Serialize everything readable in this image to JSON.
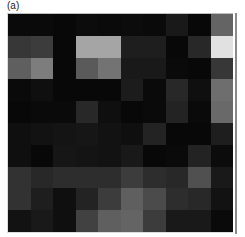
{
  "panel_label": "(a)",
  "chart_data": {
    "type": "heatmap",
    "title": "(a)",
    "colormap": "grayscale",
    "rows": 10,
    "cols": 10,
    "xlabel": "",
    "ylabel": "",
    "value_range": [
      0,
      255
    ],
    "values": [
      [
        10,
        10,
        8,
        12,
        10,
        12,
        10,
        25,
        8,
        100
      ],
      [
        55,
        60,
        8,
        165,
        165,
        30,
        30,
        8,
        40,
        225
      ],
      [
        95,
        125,
        8,
        90,
        115,
        25,
        25,
        10,
        8,
        55
      ],
      [
        10,
        15,
        8,
        8,
        8,
        28,
        10,
        40,
        15,
        110
      ],
      [
        8,
        10,
        10,
        40,
        15,
        8,
        10,
        35,
        10,
        105
      ],
      [
        15,
        18,
        20,
        22,
        18,
        15,
        35,
        8,
        8,
        30
      ],
      [
        15,
        8,
        22,
        20,
        18,
        25,
        8,
        10,
        35,
        12
      ],
      [
        50,
        40,
        45,
        45,
        45,
        60,
        45,
        40,
        80,
        25
      ],
      [
        50,
        30,
        15,
        35,
        60,
        95,
        75,
        45,
        40,
        18
      ],
      [
        18,
        25,
        15,
        65,
        95,
        100,
        60,
        25,
        25,
        10
      ]
    ],
    "grid": false,
    "legend": "none"
  }
}
